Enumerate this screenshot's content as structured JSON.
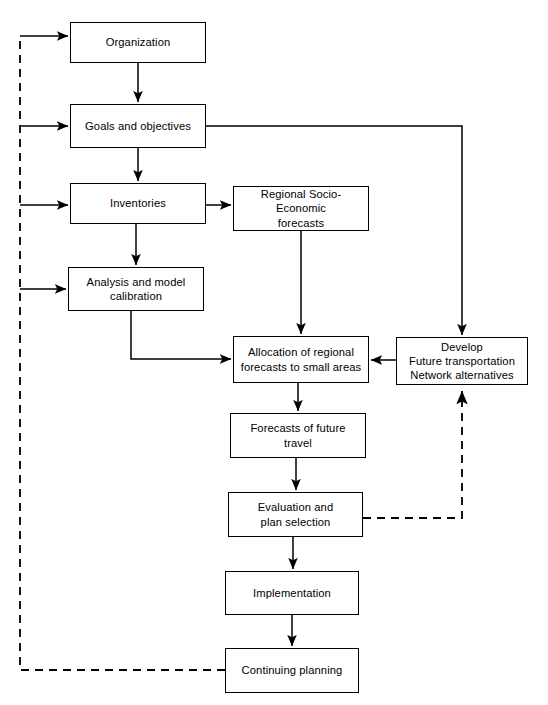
{
  "diagram": {
    "line_color": "#000000",
    "background_color": "#ffffff",
    "nodes": [
      {
        "id": "organization",
        "label": "Organization",
        "x": 70,
        "y": 22,
        "w": 136,
        "h": 41
      },
      {
        "id": "goals",
        "label": "Goals and objectives",
        "x": 70,
        "y": 104,
        "w": 136,
        "h": 44
      },
      {
        "id": "inventories",
        "label": "Inventories",
        "x": 70,
        "y": 183,
        "w": 136,
        "h": 41
      },
      {
        "id": "regional-forecasts",
        "label": "Regional Socio-Economic\nforecasts",
        "x": 233,
        "y": 186,
        "w": 136,
        "h": 45
      },
      {
        "id": "analysis",
        "label": "Analysis and model\ncalibration",
        "x": 68,
        "y": 267,
        "w": 136,
        "h": 44
      },
      {
        "id": "allocation",
        "label": "Allocation of regional\nforecasts to small areas",
        "x": 233,
        "y": 336,
        "w": 136,
        "h": 47
      },
      {
        "id": "develop",
        "label": "Develop\nFuture transportation\nNetwork alternatives",
        "x": 396,
        "y": 337,
        "w": 132,
        "h": 48
      },
      {
        "id": "forecasts-travel",
        "label": "Forecasts of future\ntravel",
        "x": 230,
        "y": 413,
        "w": 136,
        "h": 45
      },
      {
        "id": "evaluation",
        "label": "Evaluation and\nplan selection",
        "x": 228,
        "y": 492,
        "w": 135,
        "h": 45
      },
      {
        "id": "implementation",
        "label": "Implementation",
        "x": 225,
        "y": 571,
        "w": 134,
        "h": 44
      },
      {
        "id": "continuing-planning",
        "label": "Continuing planning",
        "x": 225,
        "y": 648,
        "w": 134,
        "h": 45
      }
    ],
    "edges": [
      {
        "id": "organization-to-goals",
        "style": "solid",
        "arrow": true
      },
      {
        "id": "goals-to-inventories",
        "style": "solid",
        "arrow": true
      },
      {
        "id": "inventories-to-analysis",
        "style": "solid",
        "arrow": true
      },
      {
        "id": "inventories-to-regional-forecasts",
        "style": "solid",
        "arrow": true
      },
      {
        "id": "regional-forecasts-to-allocation",
        "style": "solid",
        "arrow": true
      },
      {
        "id": "analysis-to-allocation",
        "style": "solid",
        "arrow": true
      },
      {
        "id": "goals-to-develop",
        "style": "solid",
        "arrow": true
      },
      {
        "id": "develop-to-allocation",
        "style": "solid",
        "arrow": true
      },
      {
        "id": "allocation-to-forecasts-travel",
        "style": "solid",
        "arrow": true
      },
      {
        "id": "forecasts-travel-to-evaluation",
        "style": "solid",
        "arrow": true
      },
      {
        "id": "evaluation-to-implementation",
        "style": "solid",
        "arrow": true
      },
      {
        "id": "implementation-to-continuing-planning",
        "style": "solid",
        "arrow": true
      },
      {
        "id": "evaluation-to-develop-feedback",
        "style": "dashed",
        "arrow": true
      },
      {
        "id": "continuing-planning-feedback-trunk",
        "style": "dashed",
        "arrow": false
      },
      {
        "id": "feedback-to-organization",
        "style": "solid",
        "arrow": true
      },
      {
        "id": "feedback-to-goals",
        "style": "solid",
        "arrow": true
      },
      {
        "id": "feedback-to-inventories",
        "style": "solid",
        "arrow": true
      },
      {
        "id": "feedback-to-analysis",
        "style": "solid",
        "arrow": true
      }
    ]
  }
}
